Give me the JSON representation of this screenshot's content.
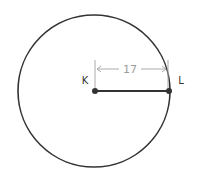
{
  "diagram": {
    "type": "circle-radius",
    "center_label": "K",
    "point_label": "L",
    "radius_value": "17",
    "colors": {
      "circle": "#333333",
      "dimension": "#a8a8a8",
      "label": "#333333"
    }
  }
}
